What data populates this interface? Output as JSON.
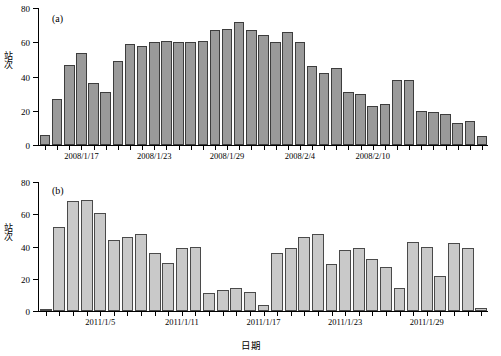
{
  "figure": {
    "xlabel": "日期",
    "panels": [
      {
        "tag": "(a)",
        "ylabel_chars": [
          "站",
          "次"
        ]
      },
      {
        "tag": "(b)",
        "ylabel_chars": [
          "站",
          "次"
        ]
      }
    ]
  },
  "chart_data": [
    {
      "type": "bar",
      "title": "(a)",
      "xlabel": "日期",
      "ylabel": "站次",
      "ylim": [
        0,
        80
      ],
      "yticks": [
        0,
        20,
        40,
        60,
        80
      ],
      "grid": false,
      "legend": "none",
      "bar_color": "#9a9a9a",
      "xtick_labels": [
        "2008/1/17",
        "2008/1/23",
        "2008/1/29",
        "2008/2/4",
        "2008/2/10"
      ],
      "xtick_indices": [
        3,
        9,
        15,
        21,
        27
      ],
      "categories": [
        "2008/1/14",
        "2008/1/15",
        "2008/1/16",
        "2008/1/17",
        "2008/1/18",
        "2008/1/19",
        "2008/1/20",
        "2008/1/21",
        "2008/1/22",
        "2008/1/23",
        "2008/1/24",
        "2008/1/25",
        "2008/1/26",
        "2008/1/27",
        "2008/1/28",
        "2008/1/29",
        "2008/1/30",
        "2008/1/31",
        "2008/2/1",
        "2008/2/2",
        "2008/2/3",
        "2008/2/4",
        "2008/2/5",
        "2008/2/6",
        "2008/2/7",
        "2008/2/8",
        "2008/2/9",
        "2008/2/10",
        "2008/2/11",
        "2008/2/12",
        "2008/2/13",
        "2008/2/14",
        "2008/2/15",
        "2008/2/16",
        "2008/2/17",
        "2008/2/18",
        "2008/2/19"
      ],
      "values": [
        6,
        27,
        47,
        54,
        36,
        31,
        49,
        59,
        58,
        60,
        61,
        60,
        60,
        61,
        67,
        68,
        72,
        67,
        64,
        60,
        66,
        60,
        46,
        42,
        45,
        31,
        30,
        23,
        24,
        38,
        38,
        20,
        19,
        18,
        13,
        14,
        5
      ]
    },
    {
      "type": "bar",
      "title": "(b)",
      "xlabel": "日期",
      "ylabel": "站次",
      "ylim": [
        0,
        80
      ],
      "yticks": [
        0,
        20,
        40,
        60,
        80
      ],
      "grid": false,
      "legend": "none",
      "bar_color": "#c9c9c9",
      "xtick_labels": [
        "2011/1/5",
        "2011/1/11",
        "2011/1/17",
        "2011/1/23",
        "2011/1/29"
      ],
      "xtick_indices": [
        4,
        10,
        16,
        22,
        28
      ],
      "categories": [
        "2011/1/1",
        "2011/1/2",
        "2011/1/3",
        "2011/1/4",
        "2011/1/5",
        "2011/1/6",
        "2011/1/7",
        "2011/1/8",
        "2011/1/9",
        "2011/1/10",
        "2011/1/11",
        "2011/1/12",
        "2011/1/13",
        "2011/1/14",
        "2011/1/15",
        "2011/1/16",
        "2011/1/17",
        "2011/1/18",
        "2011/1/19",
        "2011/1/20",
        "2011/1/21",
        "2011/1/22",
        "2011/1/23",
        "2011/1/24",
        "2011/1/25",
        "2011/1/26",
        "2011/1/27",
        "2011/1/28",
        "2011/1/29",
        "2011/1/30",
        "2011/1/31",
        "2011/2/1",
        "2011/2/2"
      ],
      "values": [
        1,
        52,
        68,
        69,
        61,
        44,
        46,
        48,
        36,
        30,
        39,
        40,
        11,
        13,
        14,
        12,
        4,
        36,
        39,
        46,
        48,
        29,
        38,
        39,
        32,
        27,
        14,
        43,
        40,
        22,
        42,
        39,
        2
      ]
    }
  ]
}
